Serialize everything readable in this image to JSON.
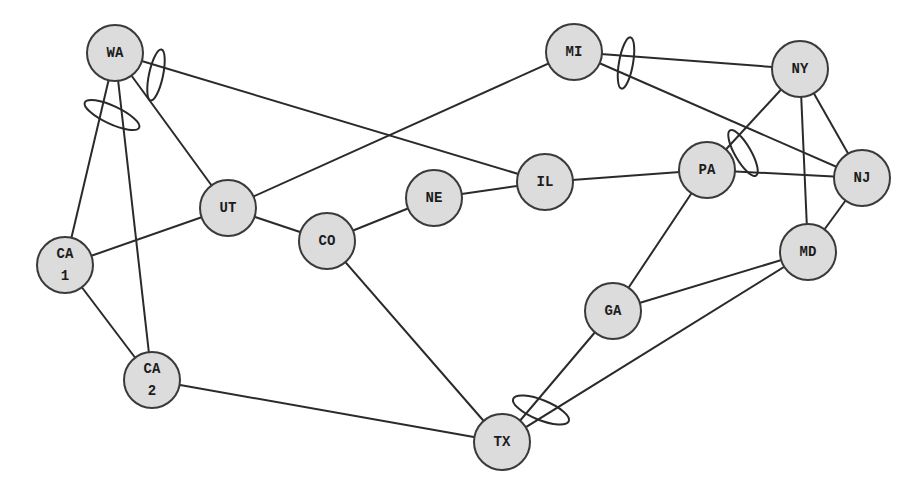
{
  "diagram": {
    "type": "network-topology",
    "node_fill": "#dcdcdc",
    "stroke_color": "#2a2a2a",
    "nodes": [
      {
        "id": "WA",
        "lines": [
          "WA"
        ],
        "x": 115,
        "y": 53,
        "r": 28
      },
      {
        "id": "CA1",
        "lines": [
          "CA",
          "1"
        ],
        "x": 65,
        "y": 265,
        "r": 28
      },
      {
        "id": "CA2",
        "lines": [
          "CA",
          "2"
        ],
        "x": 152,
        "y": 380,
        "r": 28
      },
      {
        "id": "UT",
        "lines": [
          "UT"
        ],
        "x": 228,
        "y": 208,
        "r": 28
      },
      {
        "id": "CO",
        "lines": [
          "CO"
        ],
        "x": 327,
        "y": 241,
        "r": 28
      },
      {
        "id": "NE",
        "lines": [
          "NE"
        ],
        "x": 434,
        "y": 198,
        "r": 28
      },
      {
        "id": "IL",
        "lines": [
          "IL"
        ],
        "x": 545,
        "y": 182,
        "r": 28
      },
      {
        "id": "MI",
        "lines": [
          "MI"
        ],
        "x": 574,
        "y": 52,
        "r": 28
      },
      {
        "id": "NY",
        "lines": [
          "NY"
        ],
        "x": 800,
        "y": 69,
        "r": 28
      },
      {
        "id": "PA",
        "lines": [
          "PA"
        ],
        "x": 707,
        "y": 170,
        "r": 28
      },
      {
        "id": "NJ",
        "lines": [
          "NJ"
        ],
        "x": 862,
        "y": 178,
        "r": 28
      },
      {
        "id": "MD",
        "lines": [
          "MD"
        ],
        "x": 808,
        "y": 252,
        "r": 28
      },
      {
        "id": "GA",
        "lines": [
          "GA"
        ],
        "x": 613,
        "y": 311,
        "r": 28
      },
      {
        "id": "TX",
        "lines": [
          "TX"
        ],
        "x": 502,
        "y": 442,
        "r": 28
      }
    ],
    "edges": [
      [
        "WA",
        "CA1"
      ],
      [
        "WA",
        "CA2"
      ],
      [
        "WA",
        "UT"
      ],
      [
        "WA",
        "IL"
      ],
      [
        "CA1",
        "UT"
      ],
      [
        "CA1",
        "CA2"
      ],
      [
        "CA2",
        "TX"
      ],
      [
        "UT",
        "CO"
      ],
      [
        "UT",
        "MI"
      ],
      [
        "CO",
        "NE"
      ],
      [
        "CO",
        "TX"
      ],
      [
        "NE",
        "IL"
      ],
      [
        "IL",
        "PA"
      ],
      [
        "MI",
        "NY"
      ],
      [
        "MI",
        "NJ"
      ],
      [
        "NY",
        "PA"
      ],
      [
        "NY",
        "MD"
      ],
      [
        "NY",
        "NJ"
      ],
      [
        "PA",
        "NJ"
      ],
      [
        "PA",
        "GA"
      ],
      [
        "NJ",
        "MD"
      ],
      [
        "MD",
        "GA"
      ],
      [
        "MD",
        "TX"
      ],
      [
        "GA",
        "TX"
      ]
    ],
    "link_groups": [
      {
        "at": "WA",
        "links": [
          "WA-CA1",
          "WA-CA2"
        ],
        "cx": 112,
        "cy": 115,
        "rx": 30,
        "ry": 9,
        "rotate": 25
      },
      {
        "at": "WA",
        "links": [
          "WA-UT",
          "WA-IL"
        ],
        "cx": 156,
        "cy": 75,
        "rx": 7,
        "ry": 26,
        "rotate": 12
      },
      {
        "at": "MI",
        "links": [
          "MI-NY",
          "MI-NJ"
        ],
        "cx": 626,
        "cy": 63,
        "rx": 7,
        "ry": 26,
        "rotate": 10
      },
      {
        "at": "PA",
        "links": [
          "PA-NY",
          "PA-NJ"
        ],
        "cx": 743,
        "cy": 153,
        "rx": 8,
        "ry": 26,
        "rotate": -30
      },
      {
        "at": "TX",
        "links": [
          "TX-GA",
          "TX-MD"
        ],
        "cx": 541,
        "cy": 410,
        "rx": 30,
        "ry": 10,
        "rotate": 22
      }
    ]
  }
}
